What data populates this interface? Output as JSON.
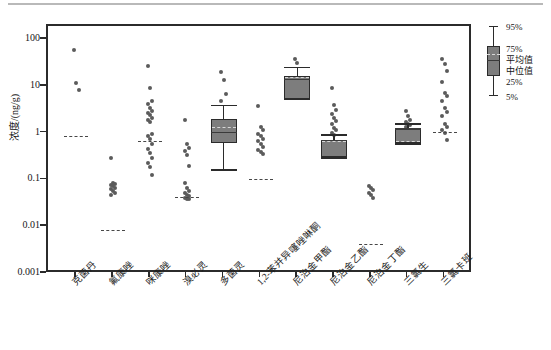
{
  "chart_data": {
    "type": "box",
    "title": "",
    "subtitle": "",
    "xlabel": "",
    "ylabel": "浓度/(ng/g)",
    "yscale": "log",
    "ylim": [
      0.001,
      200
    ],
    "grid": false,
    "legend_position": "right-outside",
    "ytick_labels": [
      "100",
      "10",
      "1",
      "0.1",
      "0.01",
      "0.001"
    ],
    "ytick_values": [
      100,
      10,
      1,
      0.1,
      0.01,
      0.001
    ],
    "categories": [
      "克菌丹",
      "氟康唑",
      "咪康唑",
      "溴必灵",
      "多菌灵",
      "1,2-苯并异噻唑啉酮",
      "尼泊金甲酯",
      "尼泊金乙酯",
      "尼泊金丁酯",
      "三氯生",
      "三氯卡班"
    ],
    "series": [
      {
        "name": "克菌丹",
        "has_box": false,
        "mean": 0.85,
        "points": [
          60,
          12,
          8.5
        ]
      },
      {
        "name": "氟康唑",
        "has_box": false,
        "mean": 0.0085,
        "points": [
          0.3,
          0.09,
          0.085,
          0.08,
          0.075,
          0.07,
          0.065,
          0.06,
          0.055,
          0.05
        ]
      },
      {
        "name": "咪康唑",
        "has_box": false,
        "mean": 0.68,
        "points": [
          28,
          9.5,
          5.0,
          4.2,
          3.6,
          3.1,
          2.8,
          2.5,
          2.2,
          2.0,
          1.8,
          1.0,
          0.9,
          0.78,
          0.6,
          0.48,
          0.38,
          0.3,
          0.24,
          0.19,
          0.13
        ]
      },
      {
        "name": "溴必灵",
        "has_box": false,
        "mean": 0.042,
        "points": [
          2.0,
          0.6,
          0.5,
          0.42,
          0.35,
          0.2,
          0.09,
          0.07,
          0.06,
          0.055,
          0.05,
          0.046,
          0.043,
          0.041,
          0.04
        ]
      },
      {
        "name": "多菌灵",
        "has_box": true,
        "q1": 0.62,
        "median": 1.05,
        "mean": 1.35,
        "q3": 2.1,
        "whisker_low": 0.17,
        "whisker_high": 4.0,
        "points": [
          21,
          14,
          7.0,
          5.0
        ]
      },
      {
        "name": "1,2-苯并异噻唑啉酮",
        "has_box": false,
        "mean": 0.105,
        "points": [
          3.9,
          1.4,
          1.2,
          1.0,
          0.9,
          0.78,
          0.68,
          0.6,
          0.52,
          0.45,
          0.4,
          0.36
        ]
      },
      {
        "name": "尼泊金甲酯",
        "has_box": true,
        "q1": 5.6,
        "median": 14.5,
        "mean": 15.5,
        "q3": 17.0,
        "whisker_low": 5.6,
        "whisker_high": 26.0,
        "points": [
          40,
          33
        ]
      },
      {
        "name": "尼泊金乙酯",
        "has_box": true,
        "q1": 0.32,
        "median": 0.72,
        "mean": 0.68,
        "q3": 0.74,
        "whisker_low": 0.3,
        "whisker_high": 0.95,
        "points": [
          9.5,
          4.0,
          3.2,
          2.6,
          2.2,
          1.9,
          1.6,
          1.35,
          1.2,
          1.05,
          0.95
        ]
      },
      {
        "name": "尼泊金丁酯",
        "has_box": false,
        "mean": 0.0042,
        "points": [
          0.075,
          0.068,
          0.062,
          0.055,
          0.05,
          0.042
        ]
      },
      {
        "name": "三氯生",
        "has_box": true,
        "q1": 0.62,
        "median": 1.25,
        "mean": 0.68,
        "q3": 1.3,
        "whisker_low": 0.6,
        "whisker_high": 1.6,
        "points": [
          3.0,
          2.4,
          2.0,
          1.8,
          1.6,
          1.5,
          1.4
        ]
      },
      {
        "name": "三氯卡班",
        "has_box": false,
        "mean": 1.05,
        "points": [
          40,
          31,
          22,
          13,
          7.5,
          6.5,
          5.0,
          3.6,
          2.9,
          2.4,
          1.6,
          1.4,
          1.2,
          1.05,
          0.72
        ]
      }
    ]
  },
  "legend": {
    "items": [
      {
        "key": "p95",
        "label": "95%"
      },
      {
        "key": "p75",
        "label": "75%"
      },
      {
        "key": "mean",
        "label": "平均值"
      },
      {
        "key": "median",
        "label": "中位值"
      },
      {
        "key": "p25",
        "label": "25%"
      },
      {
        "key": "p05",
        "label": "5%"
      }
    ]
  },
  "colors": {
    "box_fill": "#7d7d7d",
    "box_edge": "#2b2b2b",
    "point": "#5b5b5b",
    "axis": "#2b2b2b",
    "mean_dash": "#474747"
  }
}
